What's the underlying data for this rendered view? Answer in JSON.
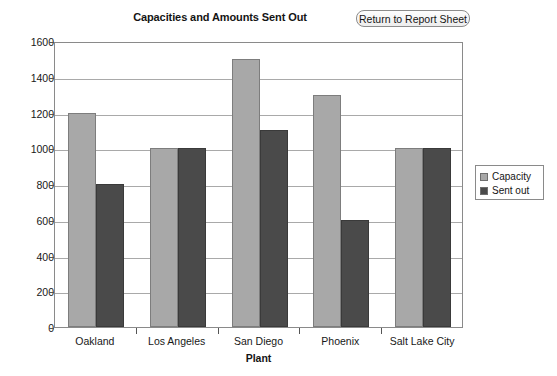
{
  "header": {
    "title": "Capacities and Amounts Sent Out",
    "return_button_label": "Return to Report Sheet"
  },
  "legend": {
    "position": "right",
    "items": [
      {
        "label": "Capacity",
        "color": "#a8a8a8"
      },
      {
        "label": "Sent out",
        "color": "#4a4a4a"
      }
    ]
  },
  "chart_data": {
    "type": "bar",
    "title": "Capacities and Amounts Sent Out",
    "xlabel": "Plant",
    "ylabel": "",
    "categories": [
      "Oakland",
      "Los Angeles",
      "San Diego",
      "Phoenix",
      "Salt Lake City"
    ],
    "series": [
      {
        "name": "Capacity",
        "color": "#a8a8a8",
        "values": [
          1200,
          1000,
          1500,
          1300,
          1000
        ]
      },
      {
        "name": "Sent out",
        "color": "#4a4a4a",
        "values": [
          800,
          1000,
          1100,
          600,
          1000
        ]
      }
    ],
    "ylim": [
      0,
      1600
    ],
    "ytick_step": 200,
    "yticks": [
      0,
      200,
      400,
      600,
      800,
      1000,
      1200,
      1400,
      1600
    ],
    "ytick_labels": [
      "0",
      "200",
      "400",
      "600",
      "800",
      "1000",
      "1200",
      "1400",
      "1600"
    ],
    "grid": "horizontal",
    "legend_position": "right"
  }
}
